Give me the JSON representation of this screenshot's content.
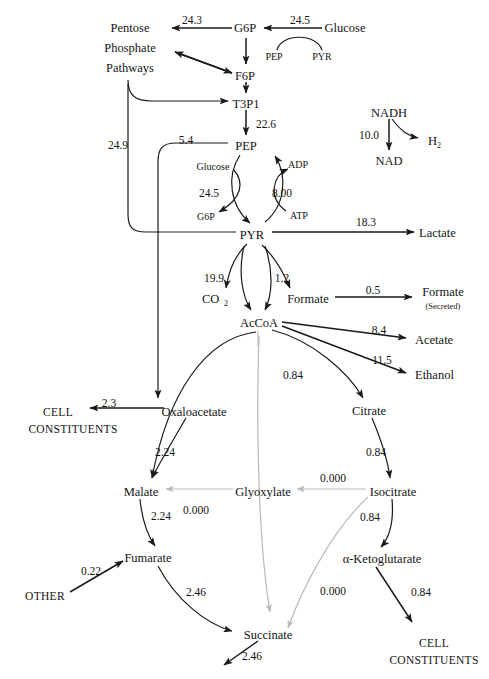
{
  "diagram": {
    "colors": {
      "line": "#1a1a1a",
      "gray_line": "#b9b9b9",
      "text": "#141414",
      "background": "#ffffff"
    },
    "nodes": [
      {
        "id": "pentose1",
        "label": "Pentose",
        "x": 130,
        "y": 32
      },
      {
        "id": "pentose2",
        "label": "Phosphate",
        "x": 130,
        "y": 52
      },
      {
        "id": "pentose3",
        "label": "Pathways",
        "x": 130,
        "y": 72
      },
      {
        "id": "g6p_top",
        "label": "G6P",
        "x": 245,
        "y": 32
      },
      {
        "id": "glucose_top",
        "label": "Glucose",
        "x": 345,
        "y": 32
      },
      {
        "id": "pep_small",
        "label": "PEP",
        "x": 274,
        "y": 56
      },
      {
        "id": "pyr_small",
        "label": "PYR",
        "x": 320,
        "y": 56
      },
      {
        "id": "f6p",
        "label": "F6P",
        "x": 245,
        "y": 76
      },
      {
        "id": "t3p1",
        "label": "T3P1",
        "x": 246,
        "y": 104
      },
      {
        "id": "pep",
        "label": "PEP",
        "x": 246,
        "y": 146
      },
      {
        "id": "nadh",
        "label": "NADH",
        "x": 389,
        "y": 113
      },
      {
        "id": "nad",
        "label": "NAD",
        "x": 389,
        "y": 161
      },
      {
        "id": "h2",
        "label": "H",
        "x": 432,
        "y": 141
      },
      {
        "id": "glucose2",
        "label": "Glucose",
        "x": 213,
        "y": 166
      },
      {
        "id": "adp",
        "label": "ADP",
        "x": 296,
        "y": 164
      },
      {
        "id": "g6p2",
        "label": "G6P",
        "x": 206,
        "y": 216
      },
      {
        "id": "atp",
        "label": "ATP",
        "x": 297,
        "y": 215
      },
      {
        "id": "pyr",
        "label": "PYR",
        "x": 252,
        "y": 235
      },
      {
        "id": "lactate",
        "label": "Lactate",
        "x": 437,
        "y": 233
      },
      {
        "id": "co2",
        "label": "CO",
        "x": 213,
        "y": 299
      },
      {
        "id": "formate",
        "label": "Formate",
        "x": 308,
        "y": 299
      },
      {
        "id": "formate_s1",
        "label": "Formate",
        "x": 440,
        "y": 292
      },
      {
        "id": "formate_s2",
        "label": "(Secreted)",
        "x": 440,
        "y": 305
      },
      {
        "id": "accoa",
        "label": "AcCoA",
        "x": 259,
        "y": 323
      },
      {
        "id": "acetate",
        "label": "Acetate",
        "x": 432,
        "y": 340
      },
      {
        "id": "ethanol",
        "label": "Ethanol",
        "x": 432,
        "y": 375
      },
      {
        "id": "oxaloacetate",
        "label": "Oxaloacetate",
        "x": 194,
        "y": 412
      },
      {
        "id": "citrate",
        "label": "Citrate",
        "x": 369,
        "y": 411
      },
      {
        "id": "cell1",
        "label": "CELL",
        "x": 56,
        "y": 412
      },
      {
        "id": "cell2",
        "label": "CONSTITUENTS",
        "x": 73,
        "y": 428
      },
      {
        "id": "malate",
        "label": "Malate",
        "x": 141,
        "y": 492
      },
      {
        "id": "glyoxylate",
        "label": "Glyoxylate",
        "x": 263,
        "y": 492
      },
      {
        "id": "isocitrate",
        "label": "Isocitrate",
        "x": 393,
        "y": 492
      },
      {
        "id": "fumarate",
        "label": "Fumarate",
        "x": 148,
        "y": 558
      },
      {
        "id": "akg",
        "label": "α-Ketoglutarate",
        "x": 382,
        "y": 559
      },
      {
        "id": "other",
        "label": "OTHER",
        "x": 45,
        "y": 596
      },
      {
        "id": "succinate",
        "label": "Succinate",
        "x": 268,
        "y": 635
      },
      {
        "id": "cell3",
        "label": "CELL",
        "x": 434,
        "y": 643
      },
      {
        "id": "cell4",
        "label": "CONSTITUENTS",
        "x": 434,
        "y": 660
      }
    ],
    "subscripts": [
      {
        "id": "h2_sub",
        "label": "2",
        "x": 441,
        "y": 144
      },
      {
        "id": "co2_sub",
        "label": "2",
        "x": 227,
        "y": 302
      }
    ],
    "fluxes": [
      {
        "id": "flux_g6p_pentose",
        "value": "24.3",
        "x": 192,
        "y": 24,
        "from": "G6P",
        "to": "Pentose Phosphate Pathways"
      },
      {
        "id": "flux_glucose_g6p",
        "value": "24.5",
        "x": 300,
        "y": 24,
        "from": "Glucose",
        "to": "G6P"
      },
      {
        "id": "flux_t3p1_pep",
        "value": "22.6",
        "x": 264,
        "y": 124,
        "from": "T3P1",
        "to": "PEP"
      },
      {
        "id": "flux_nadh_nad",
        "value": "10.0",
        "x": 369,
        "y": 135,
        "from": "NADH",
        "to": "NAD / H2"
      },
      {
        "id": "flux_pyr_loop_left",
        "value": "24.9",
        "x": 118,
        "y": 145,
        "from": "PYR",
        "to": "Pentose Phosphate / T3P1"
      },
      {
        "id": "flux_pep_oaa",
        "value": "5.4",
        "x": 186,
        "y": 140,
        "from": "PEP",
        "to": "Oxaloacetate"
      },
      {
        "id": "flux_glucose_pts",
        "value": "24.5",
        "x": 209,
        "y": 193,
        "from": "Glucose + PEP",
        "to": "G6P + PYR"
      },
      {
        "id": "flux_adp_atp",
        "value": "8.00",
        "x": 282,
        "y": 193,
        "from": "ADP + PEP",
        "to": "ATP + PYR"
      },
      {
        "id": "flux_pyr_lactate",
        "value": "18.3",
        "x": 366,
        "y": 222,
        "from": "PYR",
        "to": "Lactate"
      },
      {
        "id": "flux_pyr_co2",
        "value": "19.9",
        "x": 214,
        "y": 278,
        "from": "PYR",
        "to": "CO2 + AcCoA"
      },
      {
        "id": "flux_pyr_formate",
        "value": "1.2",
        "x": 282,
        "y": 278,
        "from": "PYR",
        "to": "Formate + AcCoA"
      },
      {
        "id": "flux_formate_secreted",
        "value": "0.5",
        "x": 373,
        "y": 290,
        "from": "Formate",
        "to": "Formate (Secreted)"
      },
      {
        "id": "flux_accoa_acetate",
        "value": "8.4",
        "x": 379,
        "y": 330,
        "from": "AcCoA",
        "to": "Acetate"
      },
      {
        "id": "flux_accoa_ethanol",
        "value": "11.5",
        "x": 382,
        "y": 360,
        "from": "AcCoA",
        "to": "Ethanol"
      },
      {
        "id": "flux_accoa_citrate",
        "value": "0.84",
        "x": 293,
        "y": 375,
        "from": "AcCoA",
        "to": "Citrate"
      },
      {
        "id": "flux_oaa_cell",
        "value": "2.3",
        "x": 109,
        "y": 403,
        "from": "Oxaloacetate",
        "to": "CELL CONSTITUENTS"
      },
      {
        "id": "flux_oaa_malate",
        "value": "2.24",
        "x": 163,
        "y": 452,
        "from": "Oxaloacetate",
        "to": "Malate"
      },
      {
        "id": "flux_citrate_isocit",
        "value": "0.84",
        "x": 376,
        "y": 452,
        "from": "Citrate",
        "to": "Isocitrate"
      },
      {
        "id": "flux_glyox_malate",
        "value": "0.000",
        "x": 196,
        "y": 510,
        "from": "Glyoxylate",
        "to": "Malate"
      },
      {
        "id": "flux_isocit_glyox",
        "value": "0.000",
        "x": 333,
        "y": 478,
        "from": "Isocitrate",
        "to": "Glyoxylate"
      },
      {
        "id": "flux_malate_fumarate",
        "value": "2.24",
        "x": 159,
        "y": 516,
        "from": "Malate",
        "to": "Fumarate"
      },
      {
        "id": "flux_isocit_akg",
        "value": "0.84",
        "x": 370,
        "y": 517,
        "from": "Isocitrate",
        "to": "α-Ketoglutarate"
      },
      {
        "id": "flux_other_fumarate",
        "value": "0.22",
        "x": 91,
        "y": 571,
        "from": "OTHER",
        "to": "Fumarate"
      },
      {
        "id": "flux_fumarate_succ",
        "value": "2.46",
        "x": 196,
        "y": 592,
        "from": "Fumarate",
        "to": "Succinate"
      },
      {
        "id": "flux_akg_succinate",
        "value": "0.000",
        "x": 333,
        "y": 591,
        "from": "α-Ketoglutarate",
        "to": "Succinate"
      },
      {
        "id": "flux_akg_cell",
        "value": "0.84",
        "x": 421,
        "y": 592,
        "from": "α-Ketoglutarate",
        "to": "CELL CONSTITUENTS"
      },
      {
        "id": "flux_succinate_out",
        "value": "2.46",
        "x": 252,
        "y": 656,
        "from": "Succinate",
        "to": "out"
      }
    ]
  }
}
